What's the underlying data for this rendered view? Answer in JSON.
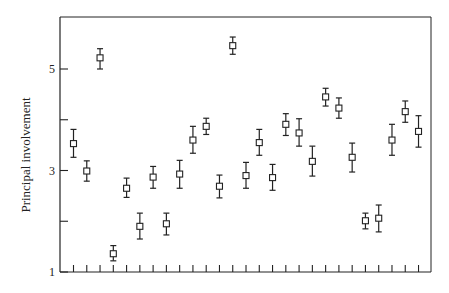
{
  "chart_data": {
    "type": "scatter",
    "title": "",
    "xlabel": "",
    "ylabel": "Principal involvement",
    "ylim": [
      1,
      6
    ],
    "yticks": [
      1,
      2,
      3,
      4,
      5
    ],
    "ytick_labels": [
      "1",
      "",
      "3",
      "",
      "5"
    ],
    "grid": false,
    "legend": null,
    "marker": "open-square",
    "error_bars": true,
    "x": [
      1,
      2,
      3,
      4,
      5,
      6,
      7,
      8,
      9,
      10,
      11,
      12,
      13,
      14,
      15,
      16,
      17,
      18,
      19,
      20,
      21,
      22,
      23,
      24,
      25,
      26,
      27
    ],
    "values": [
      3.53,
      2.99,
      5.22,
      1.36,
      2.65,
      1.9,
      2.87,
      1.95,
      2.93,
      3.6,
      3.87,
      2.69,
      5.46,
      2.9,
      3.55,
      2.86,
      3.91,
      3.74,
      3.18,
      4.45,
      4.23,
      3.26,
      2.01,
      2.06,
      3.6,
      4.16,
      3.77
    ],
    "err_low": [
      3.26,
      2.79,
      5.0,
      1.22,
      2.47,
      1.65,
      2.65,
      1.73,
      2.65,
      3.34,
      3.71,
      2.46,
      5.29,
      2.65,
      3.3,
      2.61,
      3.69,
      3.48,
      2.89,
      4.27,
      4.03,
      2.97,
      1.85,
      1.79,
      3.3,
      3.95,
      3.46
    ],
    "err_high": [
      3.81,
      3.19,
      5.4,
      1.52,
      2.85,
      2.16,
      3.08,
      2.16,
      3.2,
      3.87,
      4.03,
      2.91,
      5.63,
      3.16,
      3.81,
      3.12,
      4.12,
      4.02,
      3.48,
      4.62,
      4.43,
      3.54,
      2.16,
      2.32,
      3.91,
      4.37,
      4.08
    ]
  }
}
